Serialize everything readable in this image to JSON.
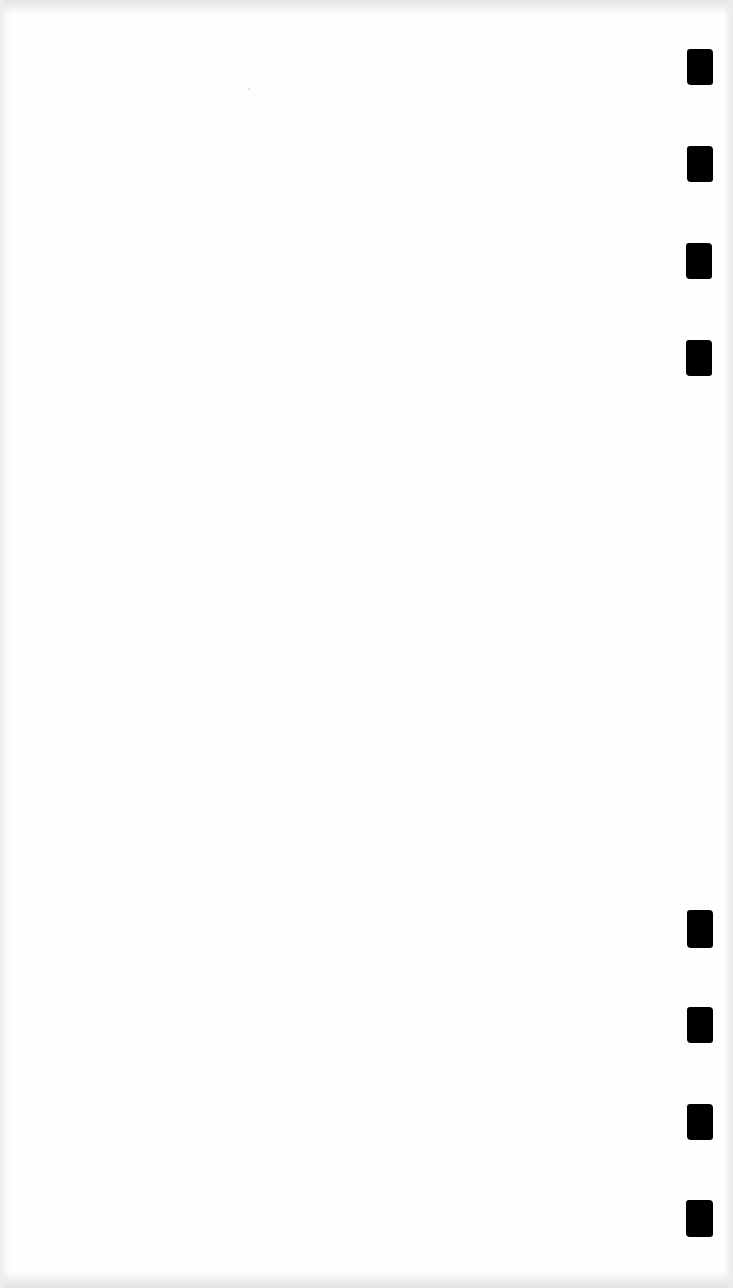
{
  "page": {
    "type": "blank scanned sheet",
    "background_color": "#fefefe",
    "content_text": ""
  },
  "timing_marks": {
    "color": "#000000",
    "count": 8,
    "top_group": [
      {
        "x": 687,
        "y": 49,
        "w": 26,
        "h": 36
      },
      {
        "x": 687,
        "y": 146,
        "w": 26,
        "h": 36
      },
      {
        "x": 686,
        "y": 243,
        "w": 26,
        "h": 36
      },
      {
        "x": 686,
        "y": 340,
        "w": 26,
        "h": 36
      }
    ],
    "bottom_group": [
      {
        "x": 687,
        "y": 910,
        "w": 26,
        "h": 38
      },
      {
        "x": 687,
        "y": 1007,
        "w": 26,
        "h": 36
      },
      {
        "x": 687,
        "y": 1104,
        "w": 26,
        "h": 36
      },
      {
        "x": 686,
        "y": 1200,
        "w": 27,
        "h": 37
      }
    ]
  }
}
